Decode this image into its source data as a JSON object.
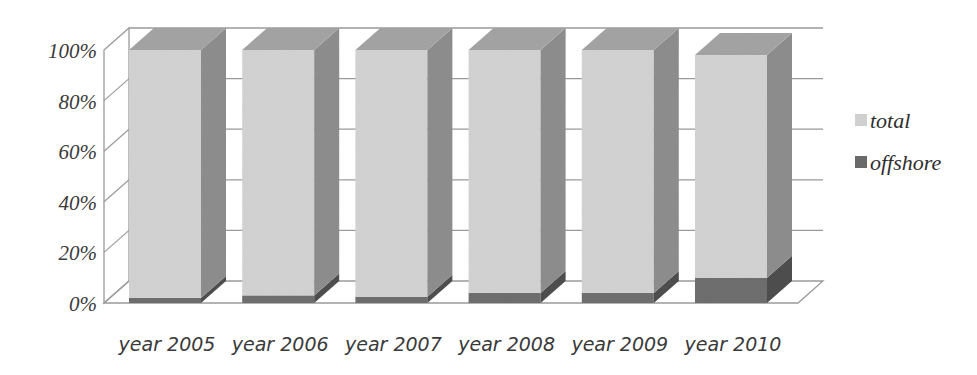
{
  "chart_data": {
    "type": "bar",
    "subtype": "3d-stacked-100-percent",
    "title": "",
    "xlabel": "",
    "ylabel": "",
    "categories": [
      "year 2005",
      "year 2006",
      "year 2007",
      "year 2008",
      "year 2009",
      "year 2010"
    ],
    "series": [
      {
        "name": "offshore",
        "color": "#6e6e6e",
        "values": [
          2,
          3,
          2.5,
          4,
          4,
          10
        ]
      },
      {
        "name": "total",
        "color": "#d4d4d4",
        "values": [
          98,
          97,
          97.5,
          96,
          96,
          88
        ]
      }
    ],
    "yticks": [
      "0%",
      "20%",
      "40%",
      "60%",
      "80%",
      "100%"
    ],
    "ylim": [
      0,
      100
    ],
    "grid": true,
    "legend_position": "right"
  },
  "legend": {
    "items": [
      {
        "label": "total",
        "color": "#d0d0d0"
      },
      {
        "label": "offshore",
        "color": "#6a6a6a"
      }
    ]
  }
}
